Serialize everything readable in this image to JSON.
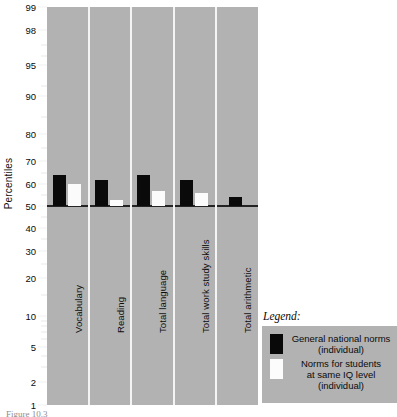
{
  "chart_data": {
    "type": "bar",
    "title": "",
    "xlabel": "",
    "ylabel": "Percentiles",
    "categories": [
      "Vocabulary",
      "Reading",
      "Total language",
      "Total work study skills",
      "Total arithmetic"
    ],
    "series": [
      {
        "name": "General national norms (individual)",
        "color": "#0a0a0a",
        "values": [
          64,
          62,
          64,
          62,
          54
        ]
      },
      {
        "name": "Norms for students at same IQ level (individual)",
        "color": "#fbfbfb",
        "values": [
          60,
          53,
          57,
          56,
          null
        ]
      }
    ],
    "baseline": 50,
    "scale": "probability",
    "ylim": [
      1,
      99
    ],
    "yticks": [
      1,
      2,
      5,
      10,
      20,
      30,
      40,
      50,
      60,
      70,
      80,
      90,
      95,
      98,
      99
    ],
    "ytick_labels": [
      "1",
      "2",
      "5",
      "10",
      "20",
      "30",
      "40",
      "50",
      "60",
      "70",
      "80",
      "90",
      "95",
      "98",
      "99"
    ],
    "yminor_ticks": [
      3,
      4,
      6,
      7,
      8,
      9,
      15,
      25,
      35,
      45,
      55,
      65,
      75,
      85,
      92,
      96,
      97
    ],
    "grid": false,
    "legend_position": "bottom-right",
    "plot_background": "#b2b2b2"
  },
  "axis": {
    "ylabel": "Percentiles"
  },
  "legend": {
    "title": "Legend:",
    "entries": [
      {
        "swatch": "black",
        "lines": [
          "General national norms",
          "(individual)"
        ]
      },
      {
        "swatch": "white",
        "lines": [
          "Norms for students",
          "at same IQ level",
          "(individual)"
        ]
      }
    ]
  },
  "caption": {
    "text": "Figure 10.3"
  }
}
